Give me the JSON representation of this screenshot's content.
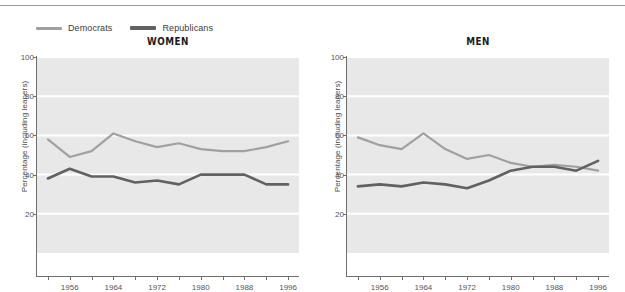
{
  "legend": {
    "items": [
      {
        "label": "Democrats",
        "color": "#a0a0a0",
        "key": "democrats"
      },
      {
        "label": "Republicans",
        "color": "#616161",
        "key": "republicans"
      }
    ]
  },
  "chart_data": [
    {
      "type": "line",
      "title": "WOMEN",
      "xlabel": "",
      "ylabel": "Percentage (including leaners)",
      "xlim": [
        1950,
        1998
      ],
      "ylim": [
        0,
        100
      ],
      "grid": true,
      "legend_position": "top-left",
      "x": [
        1952,
        1956,
        1960,
        1964,
        1968,
        1972,
        1976,
        1980,
        1984,
        1988,
        1992,
        1996
      ],
      "xticks": [
        1952,
        1956,
        1960,
        1964,
        1968,
        1972,
        1976,
        1980,
        1984,
        1988,
        1992,
        1996
      ],
      "xticklabels": [
        "",
        "1956",
        "",
        "1964",
        "",
        "1972",
        "",
        "1980",
        "",
        "1988",
        "",
        "1996"
      ],
      "yticks": [
        20,
        40,
        60,
        80,
        100
      ],
      "yticklabels": [
        "20",
        "40",
        "60",
        "80",
        "100"
      ],
      "series": [
        {
          "name": "Democrats",
          "color": "#a0a0a0",
          "values": [
            58,
            49,
            52,
            61,
            57,
            54,
            56,
            53,
            52,
            52,
            54,
            57
          ]
        },
        {
          "name": "Republicans",
          "color": "#616161",
          "values": [
            38,
            43,
            39,
            39,
            36,
            37,
            35,
            40,
            40,
            40,
            35,
            35
          ]
        }
      ]
    },
    {
      "type": "line",
      "title": "MEN",
      "xlabel": "",
      "ylabel": "Percentage (including leaners)",
      "xlim": [
        1950,
        1998
      ],
      "ylim": [
        0,
        100
      ],
      "grid": true,
      "legend_position": "top-left",
      "x": [
        1952,
        1956,
        1960,
        1964,
        1968,
        1972,
        1976,
        1980,
        1984,
        1988,
        1992,
        1996
      ],
      "xticks": [
        1952,
        1956,
        1960,
        1964,
        1968,
        1972,
        1976,
        1980,
        1984,
        1988,
        1992,
        1996
      ],
      "xticklabels": [
        "",
        "1956",
        "",
        "1964",
        "",
        "1972",
        "",
        "1980",
        "",
        "1988",
        "",
        "1996"
      ],
      "yticks": [
        20,
        40,
        60,
        80,
        100
      ],
      "yticklabels": [
        "20",
        "40",
        "60",
        "80",
        "100"
      ],
      "series": [
        {
          "name": "Democrats",
          "color": "#a0a0a0",
          "values": [
            59,
            55,
            53,
            61,
            53,
            48,
            50,
            46,
            44,
            45,
            44,
            42
          ]
        },
        {
          "name": "Republicans",
          "color": "#616161",
          "values": [
            34,
            35,
            34,
            36,
            35,
            33,
            37,
            42,
            44,
            44,
            42,
            47
          ]
        }
      ]
    }
  ],
  "colors": {
    "democrats": "#a0a0a0",
    "republicans": "#616161",
    "plot_background": "#e8e8e8",
    "gridline": "#ffffff",
    "axis": "#6f6f6f",
    "page_background": "#ffffff"
  }
}
